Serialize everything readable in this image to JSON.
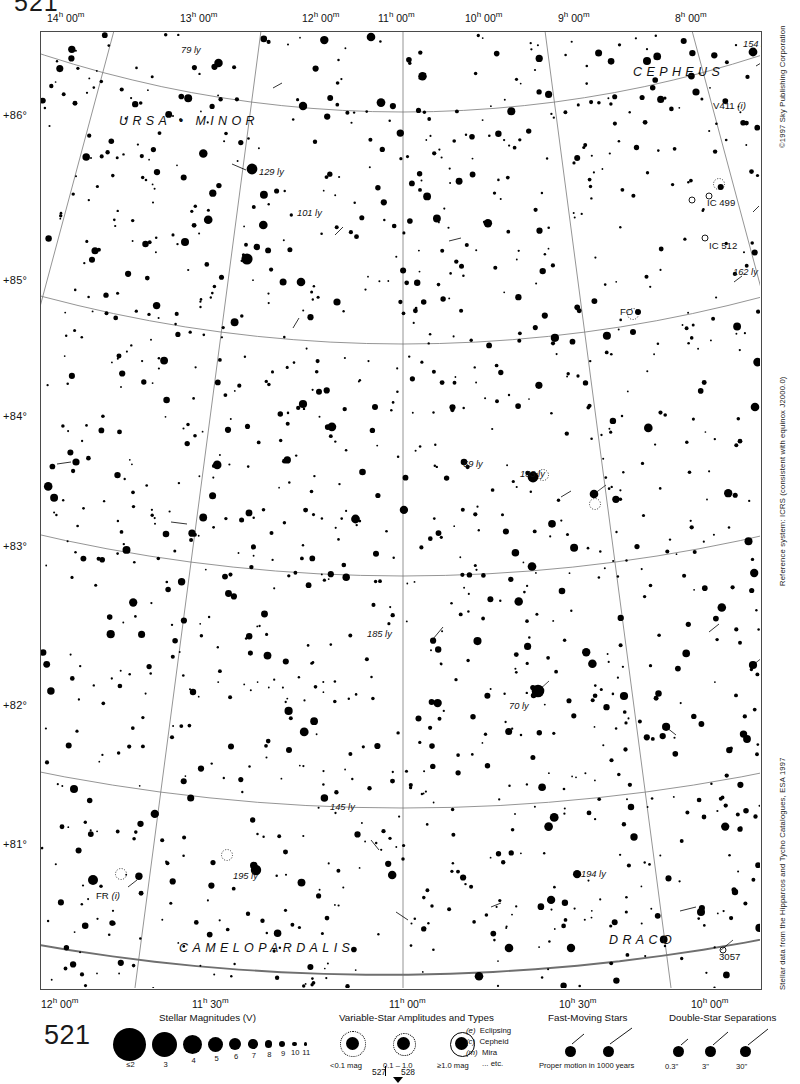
{
  "page": {
    "number_top": "521",
    "number_legend": "521",
    "adjacent_left": "527",
    "adjacent_right": "528"
  },
  "chart": {
    "ra_labels_top": [
      "14h 00m",
      "13h 00m",
      "12h 00m",
      "11h 00m",
      "10h 00m",
      "9h 00m",
      "8h 00m"
    ],
    "ra_labels_bottom": [
      "12h 00m",
      "11h 30m",
      "11h 00m",
      "10h 30m",
      "10h 00m"
    ],
    "dec_labels": [
      "+86°",
      "+85°",
      "+84°",
      "+83°",
      "+82°",
      "+81°"
    ],
    "constellations": [
      {
        "name": "URSA • MINOR",
        "x": 118,
        "y": 113
      },
      {
        "name": "CEPHEUS",
        "x": 632,
        "y": 64
      },
      {
        "name": "CAMELOPARDALIS",
        "x": 178,
        "y": 940
      },
      {
        "name": "DRACO",
        "x": 608,
        "y": 932
      }
    ],
    "distance_labels": [
      {
        "text": "79 ly",
        "x": 180,
        "y": 44
      },
      {
        "text": "154 ly",
        "x": 742,
        "y": 38
      },
      {
        "text": "129 ly",
        "x": 258,
        "y": 166
      },
      {
        "text": "101 ly",
        "x": 296,
        "y": 207
      },
      {
        "text": "162 ly",
        "x": 732,
        "y": 266
      },
      {
        "text": "69 ly",
        "x": 462,
        "y": 458
      },
      {
        "text": "133 ly",
        "x": 519,
        "y": 468
      },
      {
        "text": "185 ly",
        "x": 366,
        "y": 628
      },
      {
        "text": "70 ly",
        "x": 508,
        "y": 700
      },
      {
        "text": "145 ly",
        "x": 329,
        "y": 801
      },
      {
        "text": "195 ly",
        "x": 232,
        "y": 870
      },
      {
        "text": "194 ly",
        "x": 580,
        "y": 868
      }
    ],
    "objects": [
      {
        "text": "V411",
        "suffix": "(i)",
        "x": 712,
        "y": 99
      },
      {
        "text": "IC 499",
        "suffix": "",
        "x": 706,
        "y": 196
      },
      {
        "text": "IC 512",
        "suffix": "",
        "x": 708,
        "y": 239
      },
      {
        "text": "FO",
        "suffix": "",
        "x": 619,
        "y": 305
      },
      {
        "text": "FR",
        "suffix": "(i)",
        "x": 95,
        "y": 889
      },
      {
        "text": "3057",
        "suffix": "",
        "x": 718,
        "y": 950
      }
    ]
  },
  "side_notes": {
    "copyright": "©1997 Sky Publishing Corporation",
    "reference": "Reference system: ICRS (consistent with equinox J2000.0)",
    "source": "Stellar data from the Hipparcos and Tycho Catalogues, ESA 1997"
  },
  "legend": {
    "magnitudes": {
      "title": "Stellar Magnitudes (V)",
      "labels": [
        "≤2",
        "3",
        "4",
        "5",
        "6",
        "7",
        "8",
        "9",
        "10",
        "11"
      ],
      "diameters": [
        33,
        25,
        19,
        15,
        12,
        9.5,
        7.5,
        6,
        4.5,
        3.5
      ]
    },
    "variables": {
      "title": "Variable-Star Amplitudes and Types",
      "amplitude_labels": [
        "<0.1 mag",
        "0.1 – 1.0",
        "≥1.0 mag"
      ],
      "types": [
        {
          "code": "(e)",
          "name": "Eclipsing"
        },
        {
          "code": "(c)",
          "name": "Cepheid"
        },
        {
          "code": "(m)",
          "name": "Mira"
        },
        {
          "code": "",
          "name": "... etc."
        }
      ]
    },
    "fast_moving": {
      "title": "Fast-Moving Stars",
      "caption": "Proper motion in 1000 years"
    },
    "double_stars": {
      "title": "Double-Star Separations",
      "labels": [
        "0.3\"",
        "3\"",
        "30\""
      ]
    }
  }
}
